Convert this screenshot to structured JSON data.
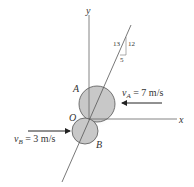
{
  "diagram": {
    "type": "collision-diagram",
    "axes": {
      "x_label": "x",
      "y_label": "y",
      "origin_label": "O"
    },
    "slope": {
      "hyp": "13",
      "rise": "12",
      "run": "5"
    },
    "disk_a": {
      "label": "A",
      "velocity_symbol": "v",
      "velocity_subscript": "A",
      "velocity_value": " = 7 m/s",
      "direction": "left"
    },
    "disk_b": {
      "label": "B",
      "velocity_symbol": "v",
      "velocity_subscript": "B",
      "velocity_value": " = 3 m/s",
      "direction": "right"
    },
    "colors": {
      "disk_fill": "#c8c8c8",
      "line": "#555555",
      "arrow": "#222222"
    }
  }
}
